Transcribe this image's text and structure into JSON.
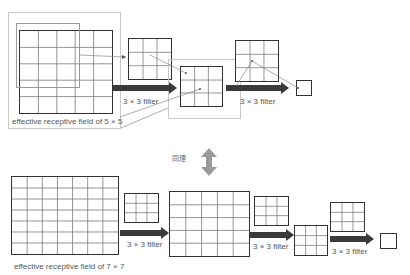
{
  "top": {
    "receptive_label": "effective receptive field of 5 × 5",
    "filter_labels": [
      "3 × 3 filter",
      "3 × 3 filter"
    ],
    "grids": [
      {
        "name": "input-grid-5x5",
        "cols": 5,
        "rows": 5
      },
      {
        "name": "filter-grid-a",
        "cols": 3,
        "rows": 3
      },
      {
        "name": "feature-grid-3x3",
        "cols": 3,
        "rows": 3
      },
      {
        "name": "filter-grid-b",
        "cols": 3,
        "rows": 3
      },
      {
        "name": "output-cell",
        "cols": 1,
        "rows": 1
      }
    ]
  },
  "middle": {
    "equivalence_label": "同理",
    "icon": "double-arrow-vertical-icon"
  },
  "bottom": {
    "receptive_label": "effective receptive field of 7 × 7",
    "filter_labels": [
      "3 × 3 filter",
      "3 × 3 filter",
      "3 × 3 filter"
    ],
    "grids": [
      {
        "name": "input-grid-7x7",
        "cols": 7,
        "rows": 7
      },
      {
        "name": "filter-grid-1",
        "cols": 3,
        "rows": 3
      },
      {
        "name": "feature-grid-5x5",
        "cols": 5,
        "rows": 5
      },
      {
        "name": "filter-grid-2",
        "cols": 3,
        "rows": 3
      },
      {
        "name": "feature-grid-3x3",
        "cols": 3,
        "rows": 3
      },
      {
        "name": "filter-grid-3",
        "cols": 3,
        "rows": 3
      },
      {
        "name": "output-cell",
        "cols": 1,
        "rows": 1
      }
    ]
  },
  "colors": {
    "grid_border": "#333333",
    "grid_line": "#777777",
    "arrow": "#3a3a3a",
    "highlight_box": "#c8c8c8",
    "equivalence_arrow": "#9a9a9a"
  }
}
